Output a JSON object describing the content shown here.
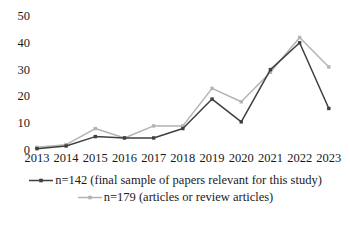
{
  "chart_data": {
    "type": "line",
    "title": "",
    "xlabel": "",
    "ylabel": "",
    "categories": [
      "2013",
      "2014",
      "2015",
      "2016",
      "2017",
      "2018",
      "2019",
      "2020",
      "2021",
      "2022",
      "2023"
    ],
    "ylim": [
      0,
      50
    ],
    "yticks": [
      0,
      10,
      20,
      30,
      40,
      50
    ],
    "grid": false,
    "legend_position": "bottom",
    "series": [
      {
        "name": "n=142 (final sample of papers relevant for this study)",
        "color": "#3f3f3f",
        "marker": "square",
        "values": [
          0.5,
          1.5,
          5,
          4.5,
          4.5,
          8,
          19,
          10.5,
          30,
          40,
          15.5
        ]
      },
      {
        "name": "n=179 (articles or review articles)",
        "color": "#b3b3b3",
        "marker": "square",
        "values": [
          1,
          2,
          8,
          4.5,
          9,
          9,
          23,
          18,
          29,
          42,
          31
        ]
      }
    ]
  }
}
